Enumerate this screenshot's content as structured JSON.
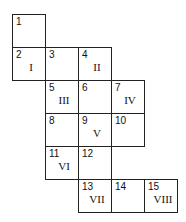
{
  "cells": [
    {
      "n": "1",
      "r": "",
      "col": 0,
      "row": 0
    },
    {
      "n": "2",
      "r": "I",
      "col": 0,
      "row": 1
    },
    {
      "n": "3",
      "r": "",
      "col": 1,
      "row": 1
    },
    {
      "n": "4",
      "r": "II",
      "col": 2,
      "row": 1
    },
    {
      "n": "5",
      "r": "III",
      "col": 1,
      "row": 2
    },
    {
      "n": "6",
      "r": "",
      "col": 2,
      "row": 2
    },
    {
      "n": "7",
      "r": "IV",
      "col": 3,
      "row": 2
    },
    {
      "n": "8",
      "r": "",
      "col": 1,
      "row": 3
    },
    {
      "n": "9",
      "r": "V",
      "col": 2,
      "row": 3
    },
    {
      "n": "10",
      "r": "",
      "col": 3,
      "row": 3
    },
    {
      "n": "11",
      "r": "VI",
      "col": 1,
      "row": 4
    },
    {
      "n": "12",
      "r": "",
      "col": 2,
      "row": 4
    },
    {
      "n": "13",
      "r": "VII",
      "col": 2,
      "row": 5
    },
    {
      "n": "14",
      "r": "",
      "col": 3,
      "row": 5
    },
    {
      "n": "15",
      "r": "VIII",
      "col": 4,
      "row": 5
    }
  ]
}
